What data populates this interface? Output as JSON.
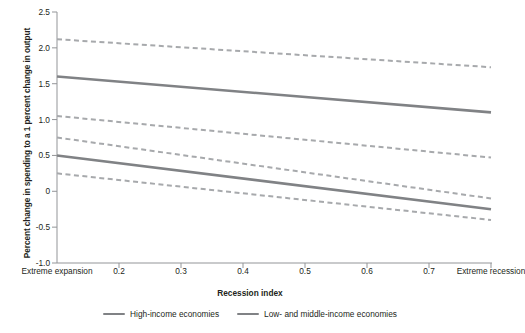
{
  "chart_data": {
    "type": "line",
    "title": "",
    "xlabel": "Recession index",
    "ylabel": "Percent change in spending to a 1 percent change in output",
    "xlim": [
      0.1,
      0.8
    ],
    "ylim": [
      -1.0,
      2.5
    ],
    "yticks": [
      "2.5",
      "2.0",
      "1.5",
      "1.0",
      "0.5",
      "0",
      "-0.5",
      "-1.0"
    ],
    "ytick_values": [
      2.5,
      2.0,
      1.5,
      1.0,
      0.5,
      0,
      -0.5,
      -1.0
    ],
    "xticks": [
      "Extreme expansion",
      "0.2",
      "0.3",
      "0.4",
      "0.5",
      "0.6",
      "0.7",
      "Extreme recession"
    ],
    "xtick_values": [
      0.1,
      0.2,
      0.3,
      0.4,
      0.5,
      0.6,
      0.7,
      0.8
    ],
    "grid": false,
    "legend_position": "bottom",
    "line_color": "#808285",
    "series": [
      {
        "name": "High-income economies",
        "style": "solid",
        "x": [
          0.1,
          0.8
        ],
        "values": [
          1.6,
          1.1
        ]
      },
      {
        "name": "High-income economies upper bound",
        "style": "dashed",
        "x": [
          0.1,
          0.8
        ],
        "values": [
          2.12,
          1.73
        ]
      },
      {
        "name": "High-income economies lower bound",
        "style": "dashed",
        "x": [
          0.1,
          0.8
        ],
        "values": [
          1.05,
          0.47
        ]
      },
      {
        "name": "Low- and middle-income economies",
        "style": "solid",
        "x": [
          0.1,
          0.8
        ],
        "values": [
          0.5,
          -0.25
        ]
      },
      {
        "name": "Low- and middle-income economies upper bound",
        "style": "dashed",
        "x": [
          0.1,
          0.8
        ],
        "values": [
          0.75,
          -0.1
        ]
      },
      {
        "name": "Low- and middle-income economies lower bound",
        "style": "dashed",
        "x": [
          0.1,
          0.8
        ],
        "values": [
          0.25,
          -0.4
        ]
      }
    ],
    "legend": [
      {
        "label": "High-income economies",
        "color": "#808285"
      },
      {
        "label": "Low- and middle-income economies",
        "color": "#808285"
      }
    ]
  },
  "axes": {
    "y_label": "Percent change in spending to a 1 percent change in output",
    "x_label": "Recession index"
  }
}
